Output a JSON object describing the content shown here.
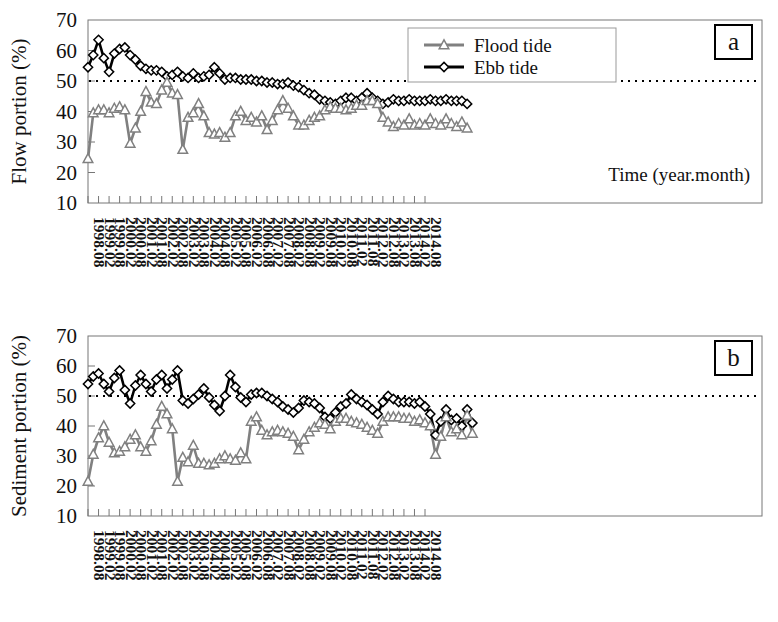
{
  "figure": {
    "xlabel": "Time (year.month)",
    "x_tick_labels": [
      "1998.08",
      "1999.02",
      "1999.08",
      "2000.02",
      "2000.08",
      "2001.02",
      "2001.08",
      "2002.02",
      "2002.08",
      "2003.02",
      "2003.08",
      "2004.02",
      "2004.08",
      "2005.02",
      "2005.08",
      "2006.02",
      "2006.08",
      "2007.02",
      "2007.08",
      "2008.02",
      "2008.08",
      "2009.02",
      "2009.08",
      "2010.02",
      "2010.08",
      "2011.02",
      "2011.08",
      "2012.02",
      "2012.08",
      "2013.02",
      "2013.08",
      "2014.02",
      "2014.08"
    ],
    "y_tick_labels": [
      "10",
      "20",
      "30",
      "40",
      "50",
      "60",
      "70"
    ],
    "legend": [
      {
        "key": "flood",
        "label": "Flood tide",
        "marker": "triangle",
        "color": "#808080"
      },
      {
        "key": "ebb",
        "label": "Ebb tide",
        "marker": "diamond",
        "color": "#000000"
      }
    ],
    "reference_line_value": 50
  },
  "chart_data": [
    {
      "type": "line",
      "panel": "a",
      "panel_label": "a",
      "title": "",
      "xlabel": "Time (year.month)",
      "ylabel": "Flow portion (%)",
      "ylim": [
        10,
        70
      ],
      "ytick_step": 10,
      "grid": false,
      "legend_position": "top-center-right",
      "reference_line": 50,
      "x_start": "1998.08",
      "x_step_months": 3,
      "x_tick_every_n_points": 2,
      "series": [
        {
          "name": "Ebb tide",
          "color": "#000000",
          "marker": "diamond",
          "values": [
            54.5,
            58.5,
            63.5,
            57.5,
            53.0,
            59.0,
            60.5,
            61.0,
            58.5,
            57.0,
            55.0,
            54.0,
            53.5,
            53.5,
            53.0,
            51.5,
            52.0,
            53.0,
            51.5,
            51.0,
            52.5,
            51.0,
            51.5,
            52.0,
            54.5,
            52.5,
            50.5,
            51.0,
            51.0,
            50.5,
            50.5,
            50.5,
            50.0,
            50.0,
            49.5,
            49.5,
            49.0,
            49.0,
            49.5,
            48.5,
            48.0,
            47.0,
            46.0,
            45.5,
            44.0,
            43.5,
            43.0,
            42.5,
            43.5,
            44.5,
            44.5,
            43.5,
            44.5,
            46.0,
            44.5,
            43.5,
            42.5,
            43.0,
            44.0,
            43.5,
            43.5,
            44.0,
            43.5,
            43.5,
            43.5,
            44.0,
            43.5,
            43.5,
            44.0,
            43.5,
            43.5,
            43.5,
            42.5
          ]
        },
        {
          "name": "Flood tide",
          "color": "#808080",
          "marker": "triangle",
          "values": [
            24.5,
            39.5,
            40.5,
            40.5,
            39.5,
            41.0,
            41.5,
            40.5,
            29.5,
            34.5,
            40.0,
            46.5,
            43.0,
            42.5,
            47.0,
            49.5,
            46.0,
            45.5,
            27.5,
            38.0,
            39.5,
            42.5,
            38.5,
            33.0,
            32.5,
            33.0,
            31.5,
            33.0,
            38.5,
            40.0,
            37.0,
            38.0,
            36.5,
            38.5,
            34.0,
            37.0,
            40.5,
            43.5,
            41.0,
            38.5,
            35.5,
            35.5,
            37.0,
            38.0,
            38.5,
            40.5,
            41.5,
            41.0,
            41.0,
            40.5,
            41.0,
            42.0,
            42.0,
            43.5,
            43.5,
            42.5,
            38.0,
            36.5,
            35.0,
            36.0,
            35.5,
            37.5,
            35.5,
            36.0,
            35.5,
            37.5,
            36.0,
            35.5,
            37.5,
            36.0,
            35.0,
            36.5,
            34.5
          ]
        }
      ]
    },
    {
      "type": "line",
      "panel": "b",
      "panel_label": "b",
      "title": "",
      "xlabel": "Time (year.month)",
      "ylabel": "Sediment portion (%)",
      "ylim": [
        10,
        70
      ],
      "ytick_step": 10,
      "grid": false,
      "legend_position": "none",
      "reference_line": 50,
      "x_start": "1998.08",
      "x_step_months": 3,
      "x_tick_every_n_points": 2,
      "series": [
        {
          "name": "Ebb tide",
          "color": "#000000",
          "marker": "diamond",
          "values": [
            54.0,
            56.5,
            57.5,
            54.0,
            51.5,
            56.0,
            58.5,
            52.0,
            47.5,
            53.5,
            57.0,
            54.0,
            51.5,
            55.5,
            57.0,
            52.5,
            55.5,
            58.5,
            48.5,
            47.5,
            49.0,
            50.5,
            52.5,
            49.5,
            47.0,
            45.0,
            50.0,
            57.0,
            53.0,
            49.5,
            48.0,
            50.5,
            51.0,
            51.0,
            50.0,
            49.0,
            48.0,
            46.5,
            45.5,
            44.5,
            46.0,
            48.5,
            48.0,
            47.5,
            46.0,
            43.0,
            42.5,
            44.5,
            46.5,
            47.5,
            50.5,
            49.0,
            48.0,
            47.0,
            45.5,
            44.0,
            48.0,
            50.0,
            49.0,
            48.0,
            48.0,
            48.0,
            47.5,
            48.0,
            46.5,
            44.0,
            37.0,
            41.5,
            45.5,
            42.0,
            42.5,
            40.0,
            45.5,
            41.0
          ]
        },
        {
          "name": "Flood tide",
          "color": "#808080",
          "marker": "triangle",
          "values": [
            21.5,
            30.5,
            36.0,
            40.0,
            34.5,
            31.0,
            31.5,
            33.0,
            35.5,
            37.0,
            33.0,
            31.5,
            35.0,
            40.5,
            46.5,
            44.0,
            39.0,
            21.5,
            29.5,
            28.0,
            33.5,
            27.5,
            27.5,
            27.0,
            27.5,
            29.0,
            30.0,
            29.0,
            28.5,
            31.0,
            29.0,
            41.5,
            43.0,
            38.5,
            37.0,
            38.0,
            38.5,
            38.0,
            37.5,
            36.5,
            32.0,
            35.5,
            38.0,
            39.5,
            41.0,
            40.5,
            39.0,
            41.5,
            42.5,
            42.5,
            41.5,
            41.0,
            40.5,
            39.5,
            38.5,
            37.5,
            41.5,
            43.0,
            43.0,
            43.0,
            42.5,
            42.5,
            41.5,
            42.0,
            41.0,
            40.0,
            30.5,
            36.5,
            43.0,
            38.0,
            39.0,
            37.0,
            43.5,
            37.5
          ]
        }
      ]
    }
  ]
}
